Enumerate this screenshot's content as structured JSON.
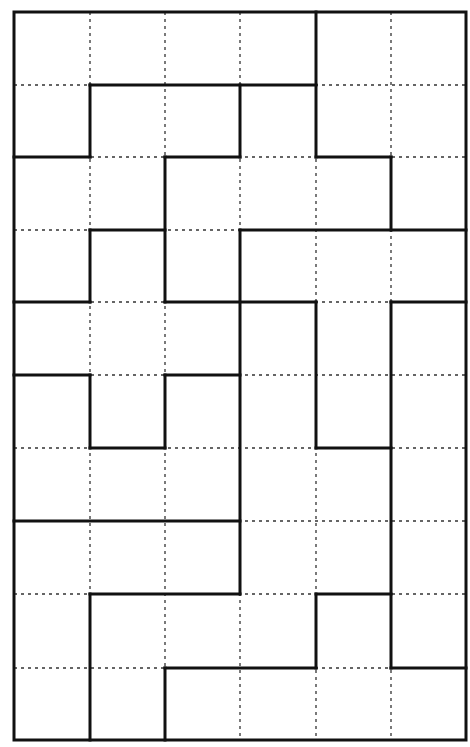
{
  "puzzle": {
    "type": "region-division-grid",
    "columns": 6,
    "rows": 10,
    "origin_px": [
      14,
      12
    ],
    "col_lines_px": [
      14,
      90,
      165,
      240,
      316,
      391,
      466
    ],
    "row_lines_px": [
      12,
      85,
      157,
      230,
      302,
      375,
      448,
      521,
      594,
      668,
      740
    ],
    "colors": {
      "background": "#ffffff",
      "thick_line": "#111111",
      "dotted_line": "#333333"
    },
    "thick_horizontal": [
      [
        1,
        1,
        4
      ],
      [
        2,
        0,
        1
      ],
      [
        2,
        2,
        3
      ],
      [
        2,
        4,
        5
      ],
      [
        3,
        1,
        2
      ],
      [
        3,
        3,
        6
      ],
      [
        4,
        0,
        1
      ],
      [
        4,
        2,
        4
      ],
      [
        4,
        5,
        6
      ],
      [
        5,
        0,
        1
      ],
      [
        5,
        2,
        3
      ],
      [
        6,
        1,
        2
      ],
      [
        6,
        4,
        5
      ],
      [
        7,
        0,
        3
      ],
      [
        8,
        1,
        3
      ],
      [
        8,
        4,
        5
      ],
      [
        9,
        2,
        4
      ],
      [
        9,
        5,
        6
      ]
    ],
    "thick_vertical": [
      [
        1,
        1,
        2
      ],
      [
        1,
        3,
        4
      ],
      [
        1,
        5,
        6
      ],
      [
        1,
        8,
        10
      ],
      [
        2,
        2,
        4
      ],
      [
        2,
        5,
        6
      ],
      [
        2,
        9,
        10
      ],
      [
        3,
        1,
        2
      ],
      [
        3,
        3,
        8
      ],
      [
        4,
        0,
        2
      ],
      [
        4,
        4,
        6
      ],
      [
        4,
        8,
        9
      ],
      [
        5,
        2,
        3
      ],
      [
        5,
        4,
        9
      ]
    ]
  }
}
